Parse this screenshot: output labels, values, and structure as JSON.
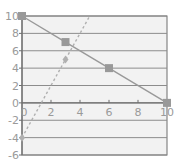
{
  "chart_data": {
    "type": "line",
    "title": "",
    "xlabel": "",
    "ylabel": "",
    "xlim": [
      0,
      10
    ],
    "ylim": [
      -6,
      10
    ],
    "x_ticks": [
      2,
      4,
      6,
      8,
      10
    ],
    "y_ticks": [
      10,
      8,
      6,
      4,
      2,
      0,
      -2,
      -4,
      -6
    ],
    "x_tick_labels": [
      "0",
      "2",
      "4",
      "6",
      "8",
      "10"
    ],
    "y_tick_labels": [
      "10",
      "8",
      "6",
      "4",
      "2",
      "0",
      "-2",
      "-4",
      "-6"
    ],
    "grid": "horizontal",
    "legend": "none",
    "series": [
      {
        "name": "solid",
        "style": "solid",
        "marker": "square",
        "color": "#999999",
        "x": [
          0,
          3,
          6,
          10
        ],
        "y": [
          10,
          7,
          4,
          0
        ]
      },
      {
        "name": "dashed",
        "style": "dashed",
        "marker": "diamond",
        "color": "#b0b0b0",
        "x": [
          0,
          3,
          4.67
        ],
        "y": [
          -4,
          5,
          10
        ],
        "marker_points": [
          [
            0,
            -4
          ],
          [
            3,
            5
          ]
        ]
      }
    ]
  },
  "colors": {
    "plot_bg": "#f2f2f2",
    "grid": "#8c8c8c",
    "axis": "#6e6e6e",
    "text": "#9a9a9a"
  }
}
